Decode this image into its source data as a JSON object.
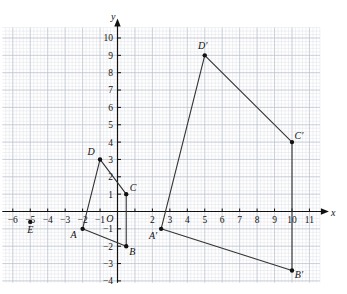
{
  "figure": {
    "type": "coordinate-plane",
    "axis_labels": {
      "x": "x",
      "y": "y",
      "origin": "O"
    },
    "grid": {
      "minor_per_major": 5,
      "major_step": 1
    }
  },
  "chart_data": {
    "type": "scatter",
    "title": "",
    "xlabel": "x",
    "ylabel": "y",
    "xlim": [
      -6.6,
      11.6
    ],
    "ylim": [
      -4.1,
      10.6
    ],
    "grid": true,
    "legend": "none",
    "xticks": [
      -6,
      -5,
      -4,
      -3,
      -2,
      -1,
      1,
      2,
      3,
      4,
      5,
      6,
      7,
      8,
      9,
      10,
      11
    ],
    "xtick_labels": [
      "−6",
      "−5",
      "−4",
      "−3",
      "−2",
      "−1",
      "",
      "2",
      "3",
      "4",
      "5",
      "6",
      "7",
      "8",
      "9",
      "10",
      "11"
    ],
    "yticks": [
      -4,
      -3,
      -2,
      -1,
      1,
      2,
      3,
      4,
      5,
      6,
      7,
      8,
      9,
      10
    ],
    "ytick_labels": [
      "−4",
      "−3",
      "−2",
      "−1",
      "1",
      "2",
      "3",
      "4",
      "5",
      "6",
      "7",
      "8",
      "9",
      "10"
    ],
    "series": [
      {
        "name": "quadrilateral ABCD",
        "closed": true,
        "points": [
          {
            "label": "A",
            "x": -2,
            "y": -1
          },
          {
            "label": "B",
            "x": 0.5,
            "y": -2
          },
          {
            "label": "C",
            "x": 0.5,
            "y": 1
          },
          {
            "label": "D",
            "x": -1,
            "y": 3
          }
        ]
      },
      {
        "name": "quadrilateral A'B'C'D'",
        "closed": true,
        "points": [
          {
            "label": "A′",
            "x": 2.5,
            "y": -1
          },
          {
            "label": "B′",
            "x": 10,
            "y": -3.4
          },
          {
            "label": "C′",
            "x": 10,
            "y": 4
          },
          {
            "label": "D′",
            "x": 5,
            "y": 9
          }
        ]
      },
      {
        "name": "centre of enlargement",
        "closed": false,
        "points": [
          {
            "label": "E",
            "x": -5,
            "y": -0.6
          }
        ]
      }
    ]
  }
}
